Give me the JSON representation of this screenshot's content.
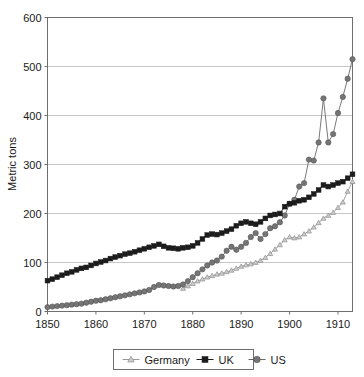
{
  "chart_data": {
    "type": "line",
    "title": "",
    "subtitle": "",
    "xlabel": "",
    "ylabel": "Metric tons",
    "xlim": [
      1850,
      1913
    ],
    "ylim": [
      0,
      600
    ],
    "xticks": [
      1850,
      1860,
      1870,
      1880,
      1890,
      1900,
      1910
    ],
    "xtick_labels": [
      "1850",
      "1860",
      "1870",
      "1880",
      "1890",
      "1900",
      "1910"
    ],
    "yticks": [
      0,
      100,
      200,
      300,
      400,
      500,
      600
    ],
    "ytick_labels": [
      "0",
      "100",
      "200",
      "300",
      "400",
      "500",
      "600"
    ],
    "grid": "horizontal",
    "legend_position": "bottom",
    "x": [
      1850,
      1851,
      1852,
      1853,
      1854,
      1855,
      1856,
      1857,
      1858,
      1859,
      1860,
      1861,
      1862,
      1863,
      1864,
      1865,
      1866,
      1867,
      1868,
      1869,
      1870,
      1871,
      1872,
      1873,
      1874,
      1875,
      1876,
      1877,
      1878,
      1879,
      1880,
      1881,
      1882,
      1883,
      1884,
      1885,
      1886,
      1887,
      1888,
      1889,
      1890,
      1891,
      1892,
      1893,
      1894,
      1895,
      1896,
      1897,
      1898,
      1899,
      1900,
      1901,
      1902,
      1903,
      1904,
      1905,
      1906,
      1907,
      1908,
      1909,
      1910,
      1911,
      1912,
      1913
    ],
    "series": [
      {
        "name": "Germany",
        "marker": "triangle",
        "color": "#b4b4b4",
        "line_color": "#9a9a9a",
        "values": [
          null,
          null,
          null,
          null,
          null,
          null,
          null,
          null,
          null,
          null,
          null,
          null,
          null,
          null,
          null,
          null,
          null,
          null,
          null,
          null,
          null,
          null,
          null,
          null,
          null,
          null,
          null,
          null,
          47,
          52,
          57,
          62,
          66,
          70,
          73,
          76,
          78,
          81,
          84,
          88,
          92,
          95,
          97,
          100,
          104,
          110,
          118,
          127,
          136,
          146,
          152,
          150,
          152,
          158,
          164,
          172,
          181,
          190,
          196,
          202,
          212,
          223,
          245,
          265
        ]
      },
      {
        "name": "UK",
        "marker": "square",
        "color": "#1c1c1c",
        "line_color": "#1c1c1c",
        "values": [
          63,
          66,
          70,
          74,
          78,
          81,
          85,
          88,
          90,
          94,
          98,
          101,
          104,
          108,
          111,
          114,
          117,
          119,
          122,
          125,
          128,
          131,
          134,
          137,
          133,
          130,
          129,
          128,
          130,
          131,
          134,
          140,
          148,
          156,
          158,
          157,
          160,
          164,
          168,
          175,
          180,
          183,
          180,
          178,
          183,
          190,
          196,
          198,
          200,
          214,
          220,
          222,
          226,
          228,
          233,
          240,
          248,
          258,
          255,
          258,
          262,
          265,
          272,
          280
        ]
      },
      {
        "name": "US",
        "marker": "circle",
        "color": "#757575",
        "line_color": "#6a6a6a",
        "values": [
          9,
          10,
          11,
          12,
          13,
          14,
          15,
          16,
          18,
          20,
          22,
          23,
          25,
          27,
          29,
          31,
          33,
          35,
          37,
          39,
          41,
          44,
          50,
          54,
          53,
          52,
          51,
          52,
          55,
          62,
          70,
          78,
          86,
          94,
          100,
          104,
          112,
          124,
          132,
          126,
          132,
          140,
          152,
          160,
          148,
          158,
          170,
          174,
          182,
          196,
          220,
          228,
          255,
          262,
          310,
          308,
          345,
          435,
          345,
          362,
          405,
          438,
          475,
          515
        ]
      }
    ]
  },
  "legend": {
    "items": [
      {
        "label": "Germany",
        "marker": "triangle"
      },
      {
        "label": "UK",
        "marker": "square"
      },
      {
        "label": "US",
        "marker": "circle"
      }
    ]
  },
  "colors": {
    "germany": "#b4b4b4",
    "uk": "#1c1c1c",
    "us": "#757575",
    "grid": "#b9b9b9",
    "frame": "#6e6e6e",
    "text": "#1a1a1a",
    "background": "#ffffff"
  }
}
